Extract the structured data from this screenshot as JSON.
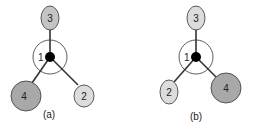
{
  "colors": {
    "background": "#ffffff",
    "stroke": "#333333",
    "node_light": "#dcdcdc",
    "node_dark": "#a8a8a8",
    "hub": "#000000"
  },
  "panels": [
    {
      "label": "(a)",
      "center_label": "1",
      "nodes": [
        {
          "label": "3",
          "shade": "light"
        },
        {
          "label": "4",
          "shade": "dark"
        },
        {
          "label": "2",
          "shade": "light"
        }
      ]
    },
    {
      "label": "(b)",
      "center_label": "1",
      "nodes": [
        {
          "label": "3",
          "shade": "light"
        },
        {
          "label": "2",
          "shade": "light"
        },
        {
          "label": "4",
          "shade": "dark"
        }
      ]
    }
  ]
}
